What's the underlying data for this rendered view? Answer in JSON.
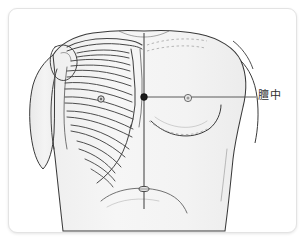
{
  "figure": {
    "kind": "acupoint-anatomical-diagram",
    "view": "anterior-torso",
    "frame": {
      "border_color": "#e3e3e3",
      "background_color": "#ffffff"
    },
    "colors": {
      "outline": "#3a3a3a",
      "bone": "#4a4a4a",
      "skin_fill": "#f2f2f2",
      "shade_fill": "#e8e8e8",
      "marker": "#1a1a1a",
      "leader_line": "#4a4a4a",
      "label_text": "#2e2e2e",
      "dashed_guide": "#8a8a8a"
    },
    "markers": [
      {
        "name": "danzhong-acupoint",
        "label": "膻中",
        "type": "filled-dot",
        "x": 135,
        "y": 88
      },
      {
        "name": "nipple-marker",
        "label": "",
        "type": "small-circle",
        "x": 179,
        "y": 89
      },
      {
        "name": "rib-acupoint-marker",
        "label": "",
        "type": "small-circle",
        "x": 92,
        "y": 90
      },
      {
        "name": "navel-marker",
        "label": "",
        "type": "oval",
        "x": 135,
        "y": 180
      }
    ],
    "leader_line": {
      "name": "danzhong-leader-line",
      "from_x": 135,
      "from_y": 88,
      "to_x": 247,
      "to_y": 88
    },
    "midline": {
      "name": "anterior-midline",
      "x": 135,
      "from_y": 24,
      "to_y": 200
    }
  },
  "labels": {
    "danzhong": "膻中"
  }
}
